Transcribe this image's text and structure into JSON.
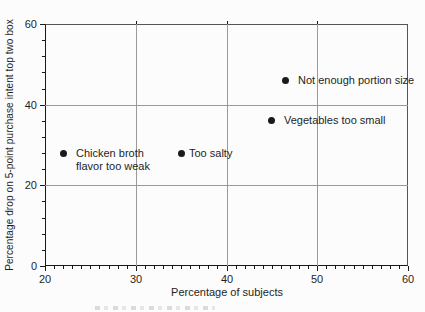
{
  "figure": {
    "background": "#fcfcfc",
    "clipped_caption_remnant": true
  },
  "chart_data": {
    "type": "scatter",
    "title": "",
    "xlabel": "Percentage of subjects",
    "ylabel": "Percentage drop on 5-point purchase intent top two box",
    "xlim": [
      20,
      60
    ],
    "ylim": [
      0,
      60
    ],
    "x_ticks": [
      20,
      30,
      40,
      50,
      60
    ],
    "y_ticks": [
      0,
      20,
      40,
      60
    ],
    "x_minor_step": 1,
    "y_minor_step": 4,
    "grid": true,
    "legend": "none",
    "points": [
      {
        "x": 22,
        "y": 28,
        "label": "Chicken broth\nflavor too weak",
        "label_gap": 9
      },
      {
        "x": 35,
        "y": 28,
        "label": "Too salty",
        "label_gap": 4
      },
      {
        "x": 45,
        "y": 36,
        "label": "Vegetables too small",
        "label_gap": 9
      },
      {
        "x": 46.5,
        "y": 46,
        "label": "Not enough portion size",
        "label_gap": 9
      }
    ],
    "colors": {
      "marker": "#1a1a1a",
      "grid": "#9a9a9a",
      "frame": "#555555",
      "axis": "#1a1a1a",
      "text": "#1f1f1f"
    }
  }
}
